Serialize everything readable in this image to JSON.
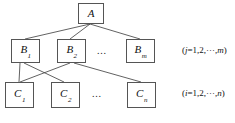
{
  "diagram": {
    "type": "hierarchy-tree",
    "levels": [
      {
        "name": "root-level",
        "nodes": [
          {
            "id": "A",
            "label": "A",
            "subscript": "",
            "x": 78,
            "y": 3,
            "w": 26,
            "h": 21
          }
        ],
        "note": ""
      },
      {
        "name": "b-level",
        "nodes": [
          {
            "id": "B1",
            "label": "B",
            "subscript": "1",
            "x": 11,
            "y": 39,
            "w": 29,
            "h": 24
          },
          {
            "id": "B2",
            "label": "B",
            "subscript": "2",
            "x": 57,
            "y": 39,
            "w": 29,
            "h": 24
          },
          {
            "id": "Bm",
            "label": "B",
            "subscript": "m",
            "x": 126,
            "y": 39,
            "w": 29,
            "h": 24
          }
        ],
        "ellipsis": {
          "text": "...",
          "x": 97,
          "y": 45
        },
        "note": "(j=1,2,···,m)",
        "note_parts": {
          "prefix": "(",
          "var": "j",
          "body": "=1,2,···,",
          "index": "m",
          "suffix": ")"
        },
        "note_x": 182,
        "note_y": 45
      },
      {
        "name": "c-level",
        "nodes": [
          {
            "id": "C1",
            "label": "C",
            "subscript": "1",
            "x": 5,
            "y": 82,
            "w": 29,
            "h": 26
          },
          {
            "id": "C2",
            "label": "C",
            "subscript": "2",
            "x": 51,
            "y": 82,
            "w": 29,
            "h": 26
          },
          {
            "id": "Cn",
            "label": "C",
            "subscript": "n",
            "x": 127,
            "y": 82,
            "w": 29,
            "h": 26
          }
        ],
        "ellipsis": {
          "text": "...",
          "x": 92,
          "y": 88
        },
        "note": "(i=1,2,···,n)",
        "note_parts": {
          "prefix": "(",
          "var": "i",
          "body": "=1,2,···,",
          "index": "n",
          "suffix": ")"
        },
        "note_x": 182,
        "note_y": 88
      }
    ],
    "edges": [
      {
        "from": "A",
        "to": "B1",
        "x1": 90,
        "y1": 24,
        "x2": 25,
        "y2": 39
      },
      {
        "from": "A",
        "to": "B2",
        "x1": 90,
        "y1": 24,
        "x2": 70,
        "y2": 39
      },
      {
        "from": "A",
        "to": "Bm",
        "x1": 90,
        "y1": 24,
        "x2": 140,
        "y2": 39
      },
      {
        "from": "B1",
        "to": "C1",
        "x1": 20,
        "y1": 63,
        "x2": 19,
        "y2": 82
      },
      {
        "from": "B1",
        "to": "C2",
        "x1": 24,
        "y1": 63,
        "x2": 64,
        "y2": 82
      },
      {
        "from": "B2",
        "to": "C1",
        "x1": 70,
        "y1": 63,
        "x2": 20,
        "y2": 82
      },
      {
        "from": "B2",
        "to": "Cn",
        "x1": 74,
        "y1": 63,
        "x2": 141,
        "y2": 82
      }
    ],
    "colors": {
      "node_border": "#555555",
      "node_fill": "#ffffff",
      "edge": "#3a3a3a",
      "text": "#111111",
      "background": "#ffffff"
    }
  }
}
